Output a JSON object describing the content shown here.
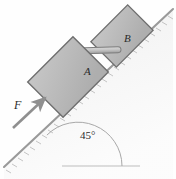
{
  "figure": {
    "type": "physics-free-body-diagram",
    "background_color": "#fefefe"
  },
  "labels": {
    "block_a": "A",
    "block_b": "B",
    "force": "F",
    "incline_angle": "45°"
  },
  "colors": {
    "block_fill": "#b9b9b9",
    "block_stroke": "#6e6e6e",
    "incline_stroke": "#9a9a9a",
    "ground_fill": "#ededed",
    "rod_fill": "#c9c9c9",
    "arrow_color": "#8f8f8f",
    "text_color": "#2b2b2b",
    "baseline_color": "#bdbdbd"
  },
  "geometry": {
    "incline_angle_degrees": 45,
    "incline_line": {
      "x1": 4,
      "y1": 167,
      "x2": 173,
      "y2": 9
    },
    "baseline": {
      "x1": 62,
      "y1": 166,
      "x2": 140,
      "y2": 166
    },
    "angle_arc_vertex": {
      "x": 78,
      "y": 166
    },
    "force_arrow": {
      "x1": 13,
      "y1": 128,
      "x2": 48,
      "y2": 95
    },
    "block_a_center": {
      "x": 68,
      "y": 76
    },
    "block_b_center": {
      "x": 122,
      "y": 36
    },
    "rod": {
      "x1": 67,
      "y1": 52,
      "x2": 120,
      "y2": 50
    }
  }
}
